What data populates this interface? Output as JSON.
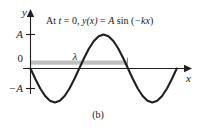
{
  "figure": {
    "caption": "(b)",
    "equation": {
      "full_text": "At t = 0, y(x) = A sin (−kx)",
      "prefix": "At ",
      "t_symbol": "t",
      "equals_zero": " = 0, ",
      "y_symbol": "y",
      "of_x": "(x)",
      "equals": " = ",
      "amplitude_symbol": "A",
      "sin": " sin (",
      "neg_k": "−k",
      "x_symbol": "x",
      "close_paren": ")"
    },
    "axes": {
      "y_axis_label": "y",
      "x_axis_label": "x",
      "y_ticks": [
        {
          "label": "A",
          "value": 1
        },
        {
          "label": "0",
          "value": 0
        },
        {
          "label": "−A",
          "value": -1
        }
      ]
    },
    "annotations": [
      {
        "name": "wavelength",
        "label": "λ",
        "color": "#bfbfbf",
        "description": "gray horizontal band spanning one wavelength"
      }
    ],
    "colors": {
      "curve": "#231f20",
      "axis": "#231f20",
      "band": "#bfbfbf",
      "background": "#ffffff"
    }
  },
  "chart_data": {
    "type": "line",
    "title": "At t = 0, y(x) = A sin (−kx)",
    "xlabel": "x",
    "ylabel": "y",
    "function": "y(x) = A sin(-kx)",
    "amplitude": 1,
    "wavelength": 1,
    "periods_shown": 1.7,
    "grid": false,
    "legend": false,
    "ylim": [
      -1.35,
      1.35
    ],
    "xlim": [
      0,
      1.7
    ],
    "ytick_labels": [
      "A",
      "0",
      "−A"
    ],
    "ytick_values": [
      1,
      0,
      -1
    ],
    "x": [
      0,
      0.05,
      0.1,
      0.15,
      0.2,
      0.25,
      0.3,
      0.35,
      0.4,
      0.45,
      0.5,
      0.55,
      0.6,
      0.65,
      0.7,
      0.75,
      0.8,
      0.85,
      0.9,
      0.95,
      1.0,
      1.05,
      1.1,
      1.15,
      1.2,
      1.25,
      1.3,
      1.35,
      1.4,
      1.45,
      1.5,
      1.55,
      1.6,
      1.65,
      1.7
    ],
    "y": [
      0,
      -0.309,
      -0.588,
      -0.809,
      -0.951,
      -1.0,
      -0.951,
      -0.809,
      -0.588,
      -0.309,
      0,
      0.309,
      0.588,
      0.809,
      0.951,
      1.0,
      0.951,
      0.809,
      0.588,
      0.309,
      0,
      -0.309,
      -0.588,
      -0.809,
      -0.951,
      -1.0,
      -0.951,
      -0.809,
      -0.588,
      -0.309,
      0,
      0.309,
      0.588,
      0.809,
      0.951
    ],
    "annotations": [
      {
        "text": "λ",
        "x_start": 0,
        "x_end": 1.0,
        "y": 0.18,
        "type": "span-marker"
      }
    ]
  }
}
